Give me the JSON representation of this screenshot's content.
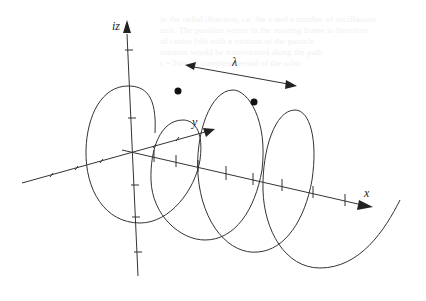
{
  "figure": {
    "labels": {
      "z_axis": "iz",
      "y_axis": "y",
      "x_axis": "x",
      "wavelength": "λ"
    },
    "colors": {
      "stroke": "#333333",
      "background": "#ffffff",
      "bleed_text": "#f0f0f0"
    },
    "markers": {
      "count": 2,
      "note": "two filled dots on consecutive crests, separated by one wavelength"
    }
  },
  "bleed_through": {
    "lines": [
      "in the radial direction, i.e. the z and a number of oscillations",
      "axis. The position vector in the rotating frame is therefore",
      "of centre (r0) with a rotation of the particle",
      "rotation would be transformed along the path",
      "t = 2π/ω, a complete period of the orbit"
    ]
  }
}
